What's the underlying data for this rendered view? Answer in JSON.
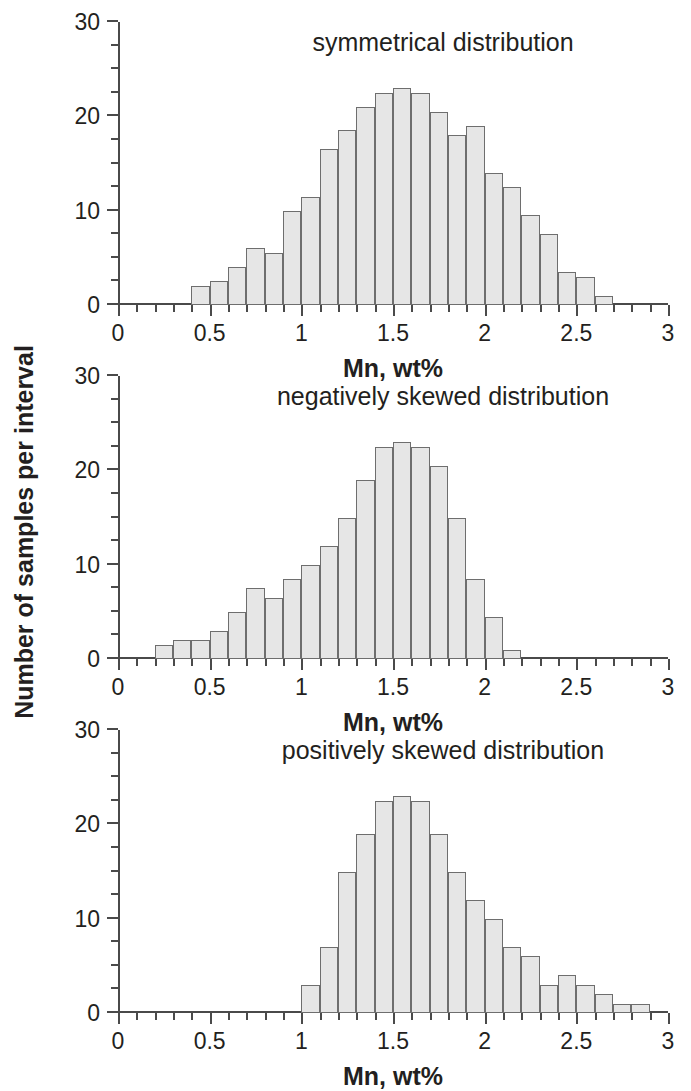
{
  "figure": {
    "ylabel": "Number of samples per interval",
    "axis_color": "#4a4a4a",
    "bar_fill": "#e6e6e6",
    "bar_stroke": "#6e6e6e",
    "text_color": "#231f20"
  },
  "chart_data": [
    {
      "type": "bar",
      "title": "symmetrical distribution",
      "xlabel": "Mn, wt%",
      "ylabel": "Number of samples per interval",
      "xlim": [
        0,
        3
      ],
      "ylim": [
        0,
        30
      ],
      "xticks": [
        0,
        0.5,
        1,
        1.5,
        2,
        2.5,
        3
      ],
      "xtick_labels": [
        "0",
        "0.5",
        "1",
        "1.5",
        "2",
        "2.5",
        "3"
      ],
      "yticks": [
        0,
        10,
        20,
        30
      ],
      "ytick_labels": [
        "0",
        "10",
        "20",
        "30"
      ],
      "minor_xtick_step": 0.1,
      "minor_ytick_step": 2.5,
      "grid": false,
      "legend": null,
      "bin_width": 0.1,
      "bin_starts": [
        0.4,
        0.5,
        0.6,
        0.7,
        0.8,
        0.9,
        1.0,
        1.1,
        1.2,
        1.3,
        1.4,
        1.5,
        1.6,
        1.7,
        1.8,
        1.9,
        2.0,
        2.1,
        2.2,
        2.3,
        2.4,
        2.5,
        2.6
      ],
      "values": [
        2,
        2.5,
        4,
        6,
        5.5,
        10,
        11.5,
        16.5,
        18.5,
        21,
        22.5,
        23,
        22.5,
        20.5,
        18,
        19,
        14,
        12.5,
        9.5,
        7.5,
        3.5,
        3,
        1
      ]
    },
    {
      "type": "bar",
      "title": "negatively skewed distribution",
      "xlabel": "Mn, wt%",
      "ylabel": "Number of samples per interval",
      "xlim": [
        0,
        3
      ],
      "ylim": [
        0,
        30
      ],
      "xticks": [
        0,
        0.5,
        1,
        1.5,
        2,
        2.5,
        3
      ],
      "xtick_labels": [
        "0",
        "0.5",
        "1",
        "1.5",
        "2",
        "2.5",
        "3"
      ],
      "yticks": [
        0,
        10,
        20,
        30
      ],
      "ytick_labels": [
        "0",
        "10",
        "20",
        "30"
      ],
      "minor_xtick_step": 0.1,
      "minor_ytick_step": 2.5,
      "grid": false,
      "legend": null,
      "bin_width": 0.1,
      "bin_starts": [
        0.2,
        0.3,
        0.4,
        0.5,
        0.6,
        0.7,
        0.8,
        0.9,
        1.0,
        1.1,
        1.2,
        1.3,
        1.4,
        1.5,
        1.6,
        1.7,
        1.8,
        1.9,
        2.0,
        2.1
      ],
      "values": [
        1.5,
        2,
        2,
        3,
        5,
        7.5,
        6.5,
        8.5,
        10,
        12,
        15,
        19,
        22.5,
        23,
        22.5,
        20.5,
        15,
        8.5,
        4.5,
        1
      ]
    },
    {
      "type": "bar",
      "title": "positively skewed distribution",
      "xlabel": "Mn, wt%",
      "ylabel": "Number of samples per interval",
      "xlim": [
        0,
        3
      ],
      "ylim": [
        0,
        30
      ],
      "xticks": [
        0,
        0.5,
        1,
        1.5,
        2,
        2.5,
        3
      ],
      "xtick_labels": [
        "0",
        "0.5",
        "1",
        "1.5",
        "2",
        "2.5",
        "3"
      ],
      "yticks": [
        0,
        10,
        20,
        30
      ],
      "ytick_labels": [
        "0",
        "10",
        "20",
        "30"
      ],
      "minor_xtick_step": 0.1,
      "minor_ytick_step": 2.5,
      "grid": false,
      "legend": null,
      "bin_width": 0.1,
      "bin_starts": [
        1.0,
        1.1,
        1.2,
        1.3,
        1.4,
        1.5,
        1.6,
        1.7,
        1.8,
        1.9,
        2.0,
        2.1,
        2.2,
        2.3,
        2.4,
        2.5,
        2.6,
        2.7,
        2.8
      ],
      "values": [
        3,
        7,
        15,
        19,
        22.5,
        23,
        22.5,
        19,
        15,
        12,
        10,
        7,
        6,
        3,
        4,
        3,
        2,
        1,
        1
      ]
    }
  ]
}
